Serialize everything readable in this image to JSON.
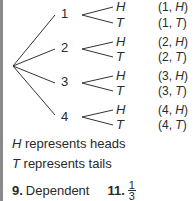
{
  "tree": {
    "first_level": [
      {
        "label": "1",
        "outcomes": [
          {
            "branch": "H",
            "pair_num": "1",
            "pair_letter": "H"
          },
          {
            "branch": "T",
            "pair_num": "1",
            "pair_letter": "T"
          }
        ]
      },
      {
        "label": "2",
        "outcomes": [
          {
            "branch": "H",
            "pair_num": "2",
            "pair_letter": "H"
          },
          {
            "branch": "T",
            "pair_num": "2",
            "pair_letter": "T"
          }
        ]
      },
      {
        "label": "3",
        "outcomes": [
          {
            "branch": "H",
            "pair_num": "3",
            "pair_letter": "H"
          },
          {
            "branch": "T",
            "pair_num": "3",
            "pair_letter": "T"
          }
        ]
      },
      {
        "label": "4",
        "outcomes": [
          {
            "branch": "H",
            "pair_num": "4",
            "pair_letter": "H"
          },
          {
            "branch": "T",
            "pair_num": "4",
            "pair_letter": "T"
          }
        ]
      }
    ]
  },
  "legend": {
    "heads_symbol": "H",
    "heads_text": " represents heads",
    "tails_symbol": "T",
    "tails_text": " represents tails"
  },
  "answers": {
    "q9_num": "9.",
    "q9_text": "Dependent",
    "q11_num": "11.",
    "q11_numerator": "1",
    "q11_denominator": "3"
  }
}
